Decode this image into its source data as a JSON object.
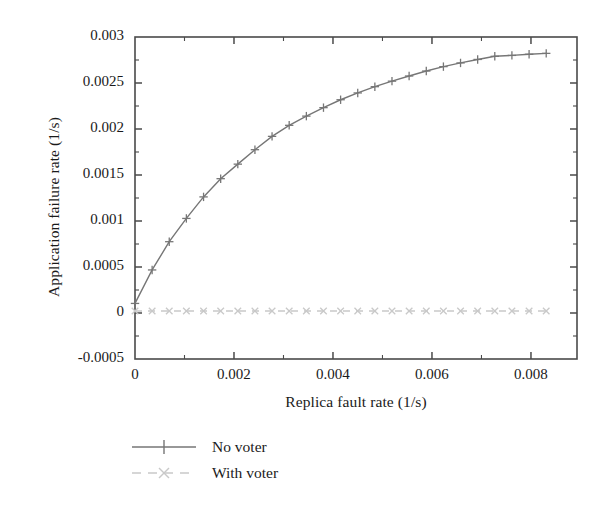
{
  "chart_data": {
    "type": "line",
    "title": "",
    "xlabel": "Replica fault rate (1/s)",
    "ylabel": "Application failure rate (1/s)",
    "xlim": [
      0,
      0.00893
    ],
    "ylim": [
      -0.0005,
      0.003
    ],
    "grid": false,
    "legend_position": "below-axis-left",
    "xticks": [
      0,
      0.002,
      0.004,
      0.006,
      0.008
    ],
    "xtick_labels": [
      "0",
      "0.002",
      "0.004",
      "0.006",
      "0.008"
    ],
    "yticks": [
      -0.0005,
      0,
      0.0005,
      0.001,
      0.0015,
      0.002,
      0.0025,
      0.003
    ],
    "ytick_labels": [
      "-0.0005",
      "0",
      "0.0005",
      "0.001",
      "0.0015",
      "0.002",
      "0.0025",
      "0.003"
    ],
    "x": [
      0.0,
      0.000346,
      0.000692,
      0.001038,
      0.001385,
      0.001731,
      0.002077,
      0.002423,
      0.002769,
      0.003115,
      0.003462,
      0.003808,
      0.004154,
      0.0045,
      0.004846,
      0.005192,
      0.005538,
      0.005885,
      0.006231,
      0.006577,
      0.006923,
      0.007269,
      0.007615,
      0.007962,
      0.008308
    ],
    "series": [
      {
        "name": "No voter",
        "marker": "plus",
        "linestyle": "solid",
        "color": "#767676",
        "values": [
          0.000104,
          0.000468,
          0.000775,
          0.001028,
          0.001262,
          0.00146,
          0.001618,
          0.001775,
          0.00192,
          0.00204,
          0.00214,
          0.002232,
          0.002318,
          0.002392,
          0.00246,
          0.00252,
          0.002576,
          0.00263,
          0.002678,
          0.002718,
          0.002756,
          0.00279,
          0.0028,
          0.002812,
          0.002822
        ]
      },
      {
        "name": "With voter",
        "marker": "cross",
        "linestyle": "dashed",
        "color": "#c9c9c9",
        "values": [
          2.2e-05,
          2.2e-05,
          2.2e-05,
          2.2e-05,
          2.2e-05,
          2.2e-05,
          2.2e-05,
          2.2e-05,
          2.2e-05,
          2.2e-05,
          2.2e-05,
          2.2e-05,
          2.2e-05,
          2.2e-05,
          2.2e-05,
          2.2e-05,
          2.2e-05,
          2.2e-05,
          2.2e-05,
          2.2e-05,
          2.2e-05,
          2.2e-05,
          2.2e-05,
          2.2e-05,
          2.2e-05
        ]
      }
    ]
  },
  "legend": {
    "items": [
      {
        "label": "No voter"
      },
      {
        "label": "With voter"
      }
    ]
  },
  "colors": {
    "frame": "#4a4a4a",
    "series_no_voter": "#767676",
    "series_with_voter": "#c9c9c9",
    "text": "#1a1a1a",
    "background": "#ffffff"
  }
}
